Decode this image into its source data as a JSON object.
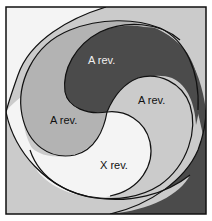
{
  "diagram": {
    "title": "",
    "labels": {
      "top": "A rev.",
      "right": "A rev.",
      "left": "A rev.",
      "bottom": "X rev."
    },
    "colors": {
      "white": "#f4f4f4",
      "light": "#cbcbcb",
      "medium": "#b3b3b3",
      "dark": "#4b4b4b",
      "line": "#111111",
      "text_on_dark": "#f0f0f0",
      "text_on_light": "#111111"
    }
  }
}
